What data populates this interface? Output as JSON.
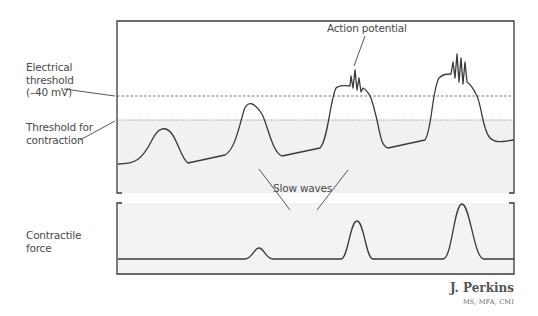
{
  "labels": {
    "electrical_threshold": "Electrical\nthreshold\n(–40 mV)",
    "contraction_threshold": "Threshold for\ncontraction",
    "action_potential": "Action potential",
    "slow_waves": "Slow waves",
    "contractile_force": "Contractile\nforce"
  },
  "signature": {
    "name": "J. Perkins",
    "credentials": "MS, MFA, CMI"
  },
  "colors": {
    "frame": "#3a3a3a",
    "trace": "#3a3a3a",
    "shade": "#f1f1f1",
    "label_text": "#4a4a4a",
    "dashed_line": "#555555"
  },
  "diagram": {
    "electrical_threshold_y": 96,
    "contraction_threshold_y": 120,
    "upper_panel": {
      "x0": 117,
      "x1": 514,
      "y_top": 21,
      "y_bottom": 193
    },
    "lower_panel": {
      "x0": 117,
      "x1": 514,
      "y_top": 203,
      "y_bottom": 274
    },
    "membrane_trace": "M118,164 C135,164 142,160 152,140 C158,128 165,125 172,134 C178,142 182,160 188,163 L225,155 C234,150 238,132 244,110 C248,100 254,102 262,114 C268,126 272,152 282,156 L320,148 C328,140 330,100 336,88 C340,84 344,86 350,86 L351,76 L353,88 L355,70 L357,90 L359,78 L361,92 L363,88 C370,92 372,100 375,112 C380,130 380,146 388,148 L425,140 C432,130 432,90 439,78 C443,74 446,74 451,74 L453,62 L455,78 L457,54 L459,82 L461,58 L463,84 L465,62 L467,82 C470,84 472,86 476,94 C482,104 482,130 490,138 C496,144 504,141 514,140",
    "force_trace": "M118,259 L245,259 C252,259 254,248 259,248 C264,248 266,259 273,259 L341,259 C348,259 350,221 357,221 C364,221 366,259 373,259 L443,259 C452,259 454,204 462,204 C470,204 474,259 484,259 L514,259",
    "leader_lines": {
      "electrical_threshold": [
        [
          64,
          89
        ],
        [
          115,
          96
        ]
      ],
      "contraction_threshold": [
        [
          80,
          140
        ],
        [
          115,
          121
        ]
      ],
      "action_potential": [
        [
          365,
          36
        ],
        [
          354,
          66
        ]
      ],
      "slow_waves_left": [
        [
          259,
          169
        ],
        [
          290,
          210
        ]
      ],
      "slow_waves_right": [
        [
          348,
          170
        ],
        [
          317,
          210
        ]
      ]
    }
  }
}
